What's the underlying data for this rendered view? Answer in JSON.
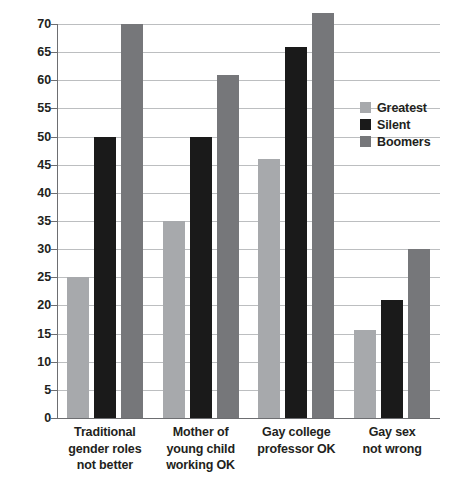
{
  "chart_data": {
    "type": "bar",
    "title": "",
    "subtitle": "",
    "xlabel": "",
    "ylabel": "",
    "ylim": [
      0,
      70
    ],
    "ytick_step": 5,
    "yticks": [
      0,
      5,
      10,
      15,
      20,
      25,
      30,
      35,
      40,
      45,
      50,
      55,
      60,
      65,
      70
    ],
    "grid": true,
    "grid_axis": "y",
    "legend_position": "right",
    "categories": [
      "Traditional gender roles not better",
      "Mother of young child working OK",
      "Gay college professor OK",
      "Gay sex not wrong"
    ],
    "category_label_lines": [
      [
        "Traditional",
        "gender roles",
        "not better"
      ],
      [
        "Mother of",
        "young child",
        "working OK"
      ],
      [
        "Gay college",
        "professor OK"
      ],
      [
        "Gay sex",
        "not wrong"
      ]
    ],
    "series": [
      {
        "name": "Greatest",
        "color": "#a7a9ac",
        "values": [
          25,
          35,
          46,
          15.7
        ]
      },
      {
        "name": "Silent",
        "color": "#1a1a1a",
        "values": [
          50,
          50,
          66,
          21
        ]
      },
      {
        "name": "Boomers",
        "color": "#76777a",
        "values": [
          70,
          61,
          72,
          30
        ]
      }
    ]
  },
  "legend": {
    "items": [
      {
        "label": "Greatest",
        "color": "#a7a9ac"
      },
      {
        "label": "Silent",
        "color": "#1a1a1a"
      },
      {
        "label": "Boomers",
        "color": "#76777a"
      }
    ]
  },
  "axis": {
    "y_tick_labels": [
      "70",
      "65",
      "60",
      "55",
      "50",
      "45",
      "40",
      "35",
      "30",
      "25",
      "20",
      "15",
      "10",
      "5",
      "0"
    ],
    "axis_color": "#6d6e71",
    "gridline_color": "#bcbec0"
  }
}
